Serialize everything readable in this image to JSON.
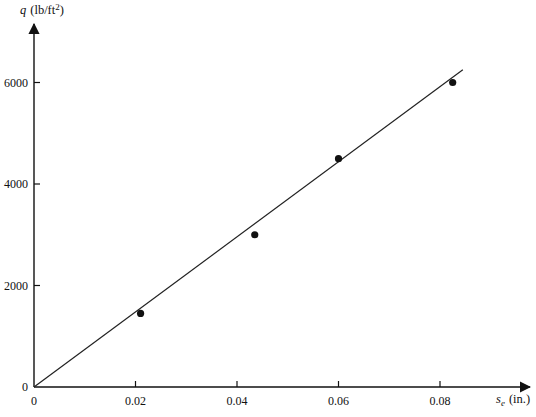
{
  "chart_data": {
    "type": "scatter",
    "title": "",
    "xlabel": "s_e (in.)",
    "ylabel": "q (lb/ft²)",
    "xlabel_parts": {
      "symbol": "s",
      "subscript": "e",
      "unit": "(in.)"
    },
    "ylabel_parts": {
      "symbol": "q",
      "unit": "(lb/ft",
      "sup": "2",
      "close": ")"
    },
    "xlim": [
      0,
      0.09
    ],
    "ylim": [
      0,
      7000
    ],
    "xticks": [
      0,
      0.02,
      0.04,
      0.06,
      0.08
    ],
    "xtick_labels": [
      "0",
      "0.02",
      "0.04",
      "0.06",
      "0.08"
    ],
    "yticks": [
      0,
      2000,
      4000,
      6000
    ],
    "ytick_labels": [
      "0",
      "2000",
      "4000",
      "6000"
    ],
    "grid": false,
    "legend": null,
    "series": [
      {
        "name": "measured",
        "kind": "scatter",
        "x": [
          0.021,
          0.0435,
          0.06,
          0.0825
        ],
        "y": [
          1450,
          3000,
          4500,
          6000
        ]
      },
      {
        "name": "best-fit line",
        "kind": "line",
        "x": [
          0,
          0.0845
        ],
        "y": [
          0,
          6250
        ]
      }
    ]
  }
}
